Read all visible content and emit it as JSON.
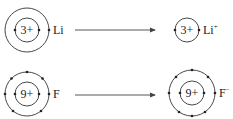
{
  "diagram": {
    "title": "",
    "colors": {
      "stroke": "#333333",
      "text": "#222222",
      "arrow": "#444444"
    },
    "rows": [
      {
        "atom": {
          "symbol": "Li",
          "nucleus_label": "3+",
          "shells": [
            2,
            1
          ],
          "center": [
            27,
            30
          ],
          "radii": [
            12,
            22
          ]
        },
        "arrow": {
          "from": [
            75,
            30
          ],
          "to": [
            155,
            30
          ]
        },
        "ion": {
          "symbol": "Li",
          "charge": "+",
          "nucleus_label": "3+",
          "shells": [
            2
          ],
          "center": [
            187,
            30
          ],
          "radii": [
            12
          ]
        }
      },
      {
        "atom": {
          "symbol": "F",
          "nucleus_label": "9+",
          "shells": [
            2,
            7
          ],
          "center": [
            27,
            94
          ],
          "radii": [
            12,
            22
          ]
        },
        "arrow": {
          "from": [
            75,
            95
          ],
          "to": [
            155,
            95
          ]
        },
        "ion": {
          "symbol": "F",
          "charge": "−",
          "nucleus_label": "9+",
          "shells": [
            2,
            8
          ],
          "center": [
            192,
            93
          ],
          "radii": [
            12,
            23
          ]
        }
      }
    ]
  }
}
